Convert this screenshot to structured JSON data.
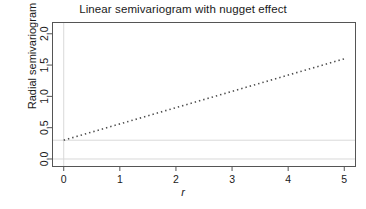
{
  "chart_data": {
    "type": "line",
    "title": "Linear semivariogram with nugget effect",
    "xlabel": "r",
    "ylabel": "Radial semivariogram",
    "xlim": [
      -0.2,
      5.2
    ],
    "ylim": [
      -0.12,
      2.18
    ],
    "xticks": [
      0,
      1,
      2,
      3,
      4,
      5
    ],
    "xtick_labels": [
      "0",
      "1",
      "2",
      "3",
      "4",
      "5"
    ],
    "yticks": [
      0.0,
      0.5,
      1.0,
      1.5,
      2.0
    ],
    "ytick_labels": [
      "0.0",
      "0.5",
      "1.0",
      "1.5",
      "2.0"
    ],
    "grid": false,
    "legend": "none",
    "line_style": "dotted",
    "line_color": "#4d4d4d",
    "series": [
      {
        "name": "Linear semivariogram with nugget",
        "nugget": 0.3,
        "slope": 0.26,
        "x": [
          0,
          0.25,
          0.5,
          0.75,
          1,
          1.25,
          1.5,
          1.75,
          2,
          2.25,
          2.5,
          2.75,
          3,
          3.25,
          3.5,
          3.75,
          4,
          4.25,
          4.5,
          4.75,
          5
        ],
        "values": [
          0.3,
          0.365,
          0.43,
          0.495,
          0.56,
          0.625,
          0.69,
          0.755,
          0.82,
          0.885,
          0.95,
          1.015,
          1.08,
          1.145,
          1.21,
          1.275,
          1.34,
          1.405,
          1.47,
          1.535,
          1.6
        ]
      }
    ],
    "reference_lines": [
      {
        "name": "nugget-level",
        "orientation": "horizontal",
        "value": 0.3,
        "color": "#d9d9d9"
      },
      {
        "name": "zero-level",
        "orientation": "horizontal",
        "value": 0.0,
        "color": "#d9d9d9"
      },
      {
        "name": "origin-vertical",
        "orientation": "vertical",
        "value": 0.0,
        "color": "#d9d9d9"
      }
    ],
    "frame_color": "#555555",
    "background": "#ffffff"
  }
}
